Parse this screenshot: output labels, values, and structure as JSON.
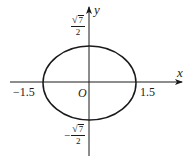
{
  "diagram": {
    "type": "ellipse-on-coordinate-axes",
    "axes": {
      "x_label": "x",
      "y_label": "y",
      "origin_label": "O"
    },
    "ellipse": {
      "center": [
        0,
        0
      ],
      "semi_axis_x": "1.5",
      "semi_axis_y": "√7/2"
    },
    "ticks": {
      "x_negative": "−1.5",
      "x_positive": "1.5",
      "y_positive": {
        "sqrt_symbol": "√",
        "radicand": "7",
        "denominator": "2"
      },
      "y_negative": {
        "sign": "−",
        "sqrt_symbol": "√",
        "radicand": "7",
        "denominator": "2"
      }
    },
    "colors": {
      "stroke": "#1a1a1a",
      "background": "#ffffff"
    }
  }
}
